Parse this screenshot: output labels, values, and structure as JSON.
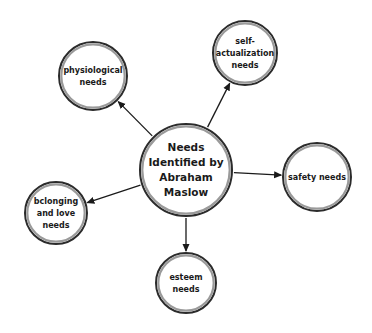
{
  "diagram": {
    "type": "concept-map",
    "center": {
      "id": "center",
      "lines": [
        "Needs",
        "Identified by",
        "Abraham",
        "Maslow"
      ],
      "cx": 186,
      "cy": 170,
      "r": 46,
      "font_size": 10.5,
      "line_height": 15
    },
    "nodes": [
      {
        "id": "physiological",
        "lines": [
          "physiological",
          "needs"
        ],
        "cx": 93,
        "cy": 76,
        "r": 34,
        "font_size": 8,
        "line_height": 12
      },
      {
        "id": "self-actualization",
        "lines": [
          "self-",
          "actualization",
          "needs"
        ],
        "cx": 245,
        "cy": 53,
        "r": 32,
        "font_size": 8,
        "line_height": 12
      },
      {
        "id": "safety",
        "lines": [
          "safety needs"
        ],
        "cx": 317,
        "cy": 177,
        "r": 34,
        "font_size": 8,
        "line_height": 12
      },
      {
        "id": "belonging",
        "lines": [
          "bclonging",
          "and love",
          "needs"
        ],
        "cx": 56,
        "cy": 213,
        "r": 31,
        "font_size": 8,
        "line_height": 12
      },
      {
        "id": "esteem",
        "lines": [
          "esteem",
          "needs"
        ],
        "cx": 186,
        "cy": 283,
        "r": 30,
        "font_size": 8,
        "line_height": 12
      }
    ],
    "edges": [
      {
        "from": "center",
        "to": "physiological",
        "direction": "center-to-node"
      },
      {
        "from": "center",
        "to": "self-actualization",
        "direction": "center-to-node"
      },
      {
        "from": "center",
        "to": "safety",
        "direction": "center-to-node"
      },
      {
        "from": "center",
        "to": "belonging",
        "direction": "center-to-node"
      },
      {
        "from": "center",
        "to": "esteem",
        "direction": "center-to-node"
      }
    ],
    "colors": {
      "background": "#ffffff",
      "circle_fill": "#ffffff",
      "circle_outer_stroke": "#2b2b2b",
      "circle_inner_ring": "#9a9a9a",
      "edge": "#1a1a1a",
      "text": "#1a1a1a"
    }
  }
}
